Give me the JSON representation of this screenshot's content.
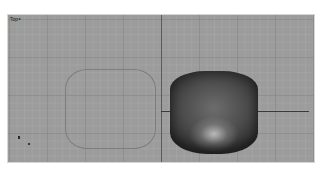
{
  "viewport": {
    "label": "Top",
    "label_arrow": "▸",
    "background_color": "#9c9c9c",
    "grid_color": "#7a7a7a"
  },
  "objects": [
    {
      "name": "wireframe-rounded-square",
      "display": "wireframe"
    },
    {
      "name": "shaded-pillow-surface",
      "display": "shaded"
    }
  ],
  "gizmo": {
    "axes": [
      "y",
      "x"
    ]
  }
}
